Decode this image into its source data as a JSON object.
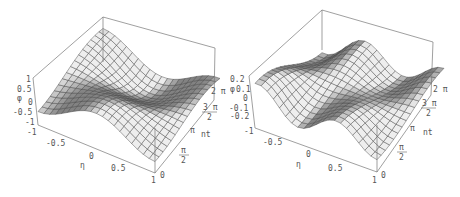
{
  "chart_data": [
    {
      "type": "surface3d",
      "title": "",
      "xlabel": "η",
      "ylabel": "nt",
      "zlabel": "φ",
      "x_ticks": [
        "-0.5",
        "0",
        "0.5",
        "1"
      ],
      "x_range": [
        -1,
        1
      ],
      "y_ticks": [
        "0",
        "π/2",
        "π",
        "3π/2",
        "2π"
      ],
      "y_range": [
        "0",
        "2π"
      ],
      "z_ticks": [
        "1",
        "0.5",
        "0",
        "-0.5",
        "-1"
      ],
      "z_range": [
        -1,
        1
      ],
      "z_bottom_label": "-1",
      "description": "Wavy surface with amplitude ~1: ridge along η=-1 edge rising near nt=0, trough near middle, oscillating along nt"
    },
    {
      "type": "surface3d",
      "title": "",
      "xlabel": "η",
      "ylabel": "nt",
      "zlabel": "φ",
      "x_ticks": [
        "-0.5",
        "0",
        "0.5",
        "1"
      ],
      "x_range": [
        -1,
        1
      ],
      "y_ticks": [
        "0",
        "π/2",
        "π",
        "3π/2",
        "2π"
      ],
      "y_range": [
        "0",
        "2π"
      ],
      "z_ticks": [
        "0.2",
        "0.1",
        "0",
        "-0.1",
        "-0.2"
      ],
      "z_range": [
        -0.2,
        0.2
      ],
      "z_bottom_label": "-1",
      "description": "Wavy surface with amplitude ~0.2: sharp peak near back corner, sinusoidal ripple across η"
    }
  ],
  "left": {
    "zlabel": "φ",
    "z_top": "1",
    "z_ticks": [
      "0.5",
      "0",
      "-0.5",
      "-1"
    ],
    "x_corner": "-1",
    "x_ticks": [
      "-0.5",
      "0",
      "0.5",
      "1"
    ],
    "xlabel": "η",
    "y_zero": "0",
    "y_pi_half_num": "π",
    "y_pi_half_den": "2",
    "y_pi": "π",
    "ylabel": "nt",
    "y_3pi_half_num": "3 π",
    "y_3pi_half_den": "2",
    "y_2pi": "2 π"
  },
  "right": {
    "zlabel": "φ",
    "z_ticks": [
      "0.2",
      "0.1",
      "0",
      "-0.1",
      "-0.2"
    ],
    "x_corner": "-1",
    "x_ticks": [
      "-0.5",
      "0",
      "0.5",
      "1"
    ],
    "xlabel": "η",
    "y_zero": "0",
    "y_pi_half_num": "π",
    "y_pi_half_den": "2",
    "y_pi": "π",
    "ylabel": "nt",
    "y_3pi_half_num": "3 π",
    "y_3pi_half_den": "2",
    "y_2pi": "2 π"
  },
  "colors": {
    "box": "#777777",
    "surface_light": "#e6e6e6",
    "surface_dark": "#8a8a8a",
    "mesh": "#444444",
    "text": "#555555"
  }
}
